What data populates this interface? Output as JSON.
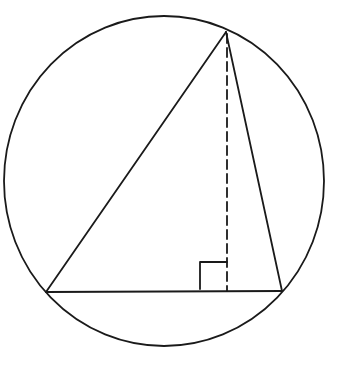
{
  "diagram": {
    "title": "",
    "colors": {
      "stroke": "#1a1a1a",
      "background": "#ffffff"
    },
    "circle": {
      "cx": 164,
      "cy": 181,
      "rx": 160,
      "ry": 165
    },
    "triangle": {
      "apex": {
        "x": 226,
        "y": 32
      },
      "base_left": {
        "x": 46,
        "y": 292
      },
      "base_right": {
        "x": 282,
        "y": 291
      }
    },
    "altitude": {
      "x1": 227,
      "y1": 34,
      "x2": 227,
      "y2": 291,
      "dash": "9 5"
    },
    "right_angle_marker": {
      "x": 200,
      "y": 262,
      "size": 27
    },
    "labels": []
  }
}
